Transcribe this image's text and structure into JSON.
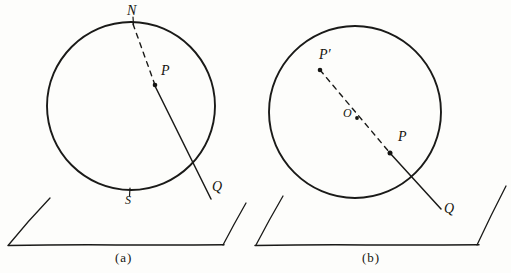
{
  "figure": {
    "panels": [
      {
        "id": "a",
        "caption": "(a)",
        "caption_pos": {
          "x": 120,
          "y": 252
        },
        "circle": {
          "cx": 131,
          "cy": 106,
          "r": 84
        },
        "labels": [
          {
            "name": "north-pole-label",
            "text": "N",
            "x": 127,
            "y": 6,
            "style": "italic"
          },
          {
            "name": "point-p-label",
            "text": "P",
            "x": 161,
            "y": 66,
            "style": "italic"
          },
          {
            "name": "south-pole-label",
            "text": "S",
            "x": 125,
            "y": 195,
            "style": "italic-small"
          },
          {
            "name": "point-q-label",
            "text": "Q",
            "x": 212,
            "y": 181,
            "style": "italic"
          }
        ],
        "dots": [
          {
            "name": "point-p-dot",
            "cx": 155,
            "cy": 85,
            "r": 2.2
          }
        ],
        "dashed_path": {
          "x1": 133,
          "y1": 23,
          "x2": 155,
          "y2": 85
        },
        "solid_ray": {
          "x1": 154,
          "y1": 84,
          "x2": 211,
          "y2": 199
        },
        "plane": {
          "base": {
            "x1": 8,
            "y1": 245,
            "x2": 224,
            "y2": 245
          },
          "left_edge": {
            "x1": 8,
            "y1": 245,
            "x2": 50,
            "y2": 198
          },
          "right_edge": {
            "x1": 223,
            "y1": 245,
            "x2": 246,
            "y2": 203
          }
        }
      },
      {
        "id": "b",
        "caption": "(b)",
        "caption_pos": {
          "x": 367,
          "y": 252
        },
        "circle": {
          "cx": 355,
          "cy": 112,
          "r": 86
        },
        "labels": [
          {
            "name": "point-p-prime-label",
            "text": "P′",
            "x": 320,
            "y": 50,
            "style": "italic"
          },
          {
            "name": "center-o-label",
            "text": "O",
            "x": 343,
            "y": 108,
            "style": "italic-small"
          },
          {
            "name": "point-p-label",
            "text": "P",
            "x": 398,
            "y": 131,
            "style": "italic"
          },
          {
            "name": "point-q-label",
            "text": "Q",
            "x": 444,
            "y": 203,
            "style": "italic"
          }
        ],
        "dots": [
          {
            "name": "point-p-prime-dot",
            "cx": 320,
            "cy": 70,
            "r": 2.2
          },
          {
            "name": "center-o-dot",
            "cx": 357,
            "cy": 118,
            "r": 1.8
          },
          {
            "name": "point-p-dot",
            "cx": 390,
            "cy": 153,
            "r": 2.4
          }
        ],
        "dashed_path": {
          "x1": 320,
          "y1": 70,
          "x2": 390,
          "y2": 153
        },
        "solid_ray": {
          "x1": 389,
          "y1": 152,
          "x2": 441,
          "y2": 209
        },
        "plane": {
          "base": {
            "x1": 255,
            "y1": 245,
            "x2": 479,
            "y2": 245
          },
          "left_edge": {
            "x1": 256,
            "y1": 245,
            "x2": 283,
            "y2": 196
          },
          "right_edge": {
            "x1": 477,
            "y1": 245,
            "x2": 506,
            "y2": 186
          }
        }
      }
    ],
    "colors": {
      "ink": "#1a1a18",
      "paper": "#fdfdfb"
    }
  }
}
